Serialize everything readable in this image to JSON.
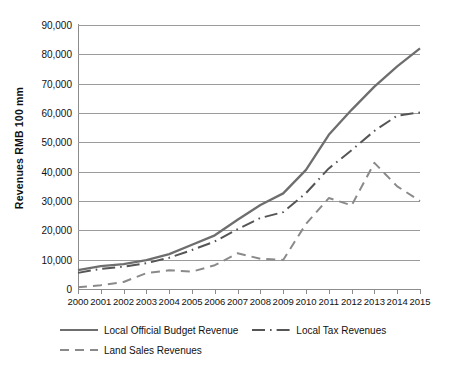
{
  "chart_data": {
    "type": "line",
    "title": "",
    "xlabel": "",
    "ylabel": "Revenues RMB 100 mm",
    "x": [
      2000,
      2001,
      2002,
      2003,
      2004,
      2005,
      2006,
      2007,
      2008,
      2009,
      2010,
      2011,
      2012,
      2013,
      2014,
      2015
    ],
    "categories": [
      "2000",
      "2001",
      "2002",
      "2003",
      "2004",
      "2005",
      "2006",
      "2007",
      "2008",
      "2009",
      "2010",
      "2011",
      "2012",
      "2013",
      "2014",
      "2015"
    ],
    "ylim": [
      0,
      90000
    ],
    "yticks": [
      0,
      10000,
      20000,
      30000,
      40000,
      50000,
      60000,
      70000,
      80000,
      90000
    ],
    "ytick_labels": [
      "0",
      "10,000",
      "20,000",
      "30,000",
      "40,000",
      "50,000",
      "60,000",
      "70,000",
      "80,000",
      "90,000"
    ],
    "grid": true,
    "legend_position": "bottom",
    "series": [
      {
        "name": "Local Official Budget Revenue",
        "style": "solid",
        "color": "#6e6e6e",
        "values": [
          6400,
          7800,
          8500,
          9850,
          11900,
          15100,
          18300,
          23600,
          28650,
          32600,
          40600,
          52550,
          61080,
          69010,
          75880,
          82000
        ]
      },
      {
        "name": "Local Tax Revenues",
        "style": "dash-dot",
        "color": "#555555",
        "values": [
          5500,
          6900,
          7600,
          8800,
          10650,
          13300,
          16200,
          20400,
          24200,
          26200,
          32700,
          41100,
          47300,
          53900,
          59100,
          60200
        ]
      },
      {
        "name": "Land Sales Revenues",
        "style": "dashed",
        "color": "#8a8a8a",
        "values": [
          600,
          1300,
          2400,
          5400,
          6400,
          5900,
          8100,
          12200,
          10300,
          9900,
          22200,
          31000,
          28500,
          43000,
          35000,
          30000
        ]
      }
    ]
  },
  "legend": {
    "items": [
      {
        "label": "Local Official Budget Revenue",
        "style": "solid"
      },
      {
        "label": "Local Tax Revenues",
        "style": "dash-dot"
      },
      {
        "label": "Land Sales Revenues",
        "style": "dashed"
      }
    ]
  },
  "axis": {
    "y_title": "Revenues RMB 100 mm"
  }
}
